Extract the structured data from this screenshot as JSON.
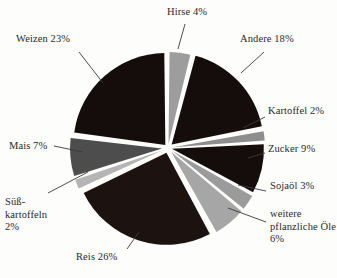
{
  "chart_data": {
    "type": "pie",
    "title": "",
    "unit": "%",
    "legend_position": "callout-labels",
    "categories": [
      "Hirse",
      "Andere",
      "Kartoffel",
      "Zucker",
      "Sojaöl",
      "weitere pflanzliche Öle",
      "Reis",
      "Süßkartoffeln",
      "Mais",
      "Weizen"
    ],
    "values": [
      4,
      18,
      2,
      9,
      3,
      6,
      26,
      2,
      7,
      23
    ],
    "slices": [
      {
        "key": "hirse",
        "name": "Hirse",
        "value": 4,
        "label": "Hirse 4%",
        "color": "#9d9d9d",
        "start_pct": 0,
        "end_pct": 4,
        "exploded": true,
        "explode_px": 4
      },
      {
        "key": "andere",
        "name": "Andere",
        "value": 18,
        "label": "Andere 18%",
        "color": "#150d0c",
        "start_pct": 4,
        "end_pct": 22,
        "exploded": true,
        "explode_px": 5
      },
      {
        "key": "kartoffel",
        "name": "Kartoffel",
        "value": 2,
        "label": "Kartoffel 2%",
        "color": "#8e8e8e",
        "start_pct": 22,
        "end_pct": 24,
        "exploded": true,
        "explode_px": 5
      },
      {
        "key": "zucker",
        "name": "Zucker",
        "value": 9,
        "label": "Zucker 9%",
        "color": "#150d0c",
        "start_pct": 24,
        "end_pct": 33,
        "exploded": true,
        "explode_px": 4
      },
      {
        "key": "sojaoel",
        "name": "Sojaöl",
        "value": 3,
        "label": "Sojaöl 3%",
        "color": "#9b9b9b",
        "start_pct": 33,
        "end_pct": 36,
        "exploded": true,
        "explode_px": 5
      },
      {
        "key": "weitere-oele",
        "name": "weitere pflanzliche Öle",
        "value": 6,
        "label": "weitere\npflanzliche\nÖle 6%",
        "color": "#a6a6a6",
        "start_pct": 36,
        "end_pct": 42,
        "exploded": true,
        "explode_px": 5
      },
      {
        "key": "reis",
        "name": "Reis",
        "value": 26,
        "label": "Reis 26%",
        "color": "#1c1311",
        "start_pct": 42,
        "end_pct": 68,
        "exploded": true,
        "explode_px": 5
      },
      {
        "key": "suesskartoffeln",
        "name": "Süßkartoffeln",
        "value": 2,
        "label": "Süß-\nkartoffeln\n2%",
        "color": "#b5b5b5",
        "start_pct": 68,
        "end_pct": 70,
        "exploded": true,
        "explode_px": 6
      },
      {
        "key": "mais",
        "name": "Mais",
        "value": 7,
        "label": "Mais 7%",
        "color": "#4d4d4d",
        "start_pct": 70,
        "end_pct": 77,
        "exploded": true,
        "explode_px": 6
      },
      {
        "key": "weizen",
        "name": "Weizen",
        "value": 23,
        "label": "Weizen 23%",
        "color": "#150d0c",
        "start_pct": 77,
        "end_pct": 100,
        "exploded": true,
        "explode_px": 4
      }
    ]
  },
  "labels": {
    "hirse": "Hirse 4%",
    "weizen": "Weizen 23%",
    "andere": "Andere 18%",
    "kartoffel": "Kartoffel 2%",
    "zucker": "Zucker 9%",
    "sojaoel": "Sojaöl 3%",
    "weitere_oele": "weitere pflanzliche Öle 6%",
    "mais": "Mais 7%",
    "suesskartoffeln": "Süß- kartoffeln 2%",
    "reis": "Reis 26%"
  },
  "colors": {
    "background": "#fdfdfc",
    "slice_dark": "#150d0c",
    "slice_mid_dark": "#4d4d4d",
    "slice_mid": "#8e8e8e",
    "slice_light": "#b5b5b5",
    "leader_line": "#3a3a3a",
    "text": "#2a2a2a"
  }
}
